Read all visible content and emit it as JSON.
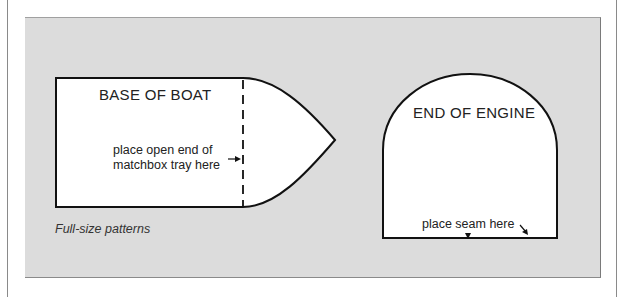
{
  "figure": {
    "caption": "Full-size patterns",
    "boat": {
      "title": "BASE OF BOAT",
      "note_line1": "place open end of",
      "note_line2": "matchbox tray here"
    },
    "engine": {
      "title": "END OF ENGINE",
      "note": "place seam here"
    }
  }
}
